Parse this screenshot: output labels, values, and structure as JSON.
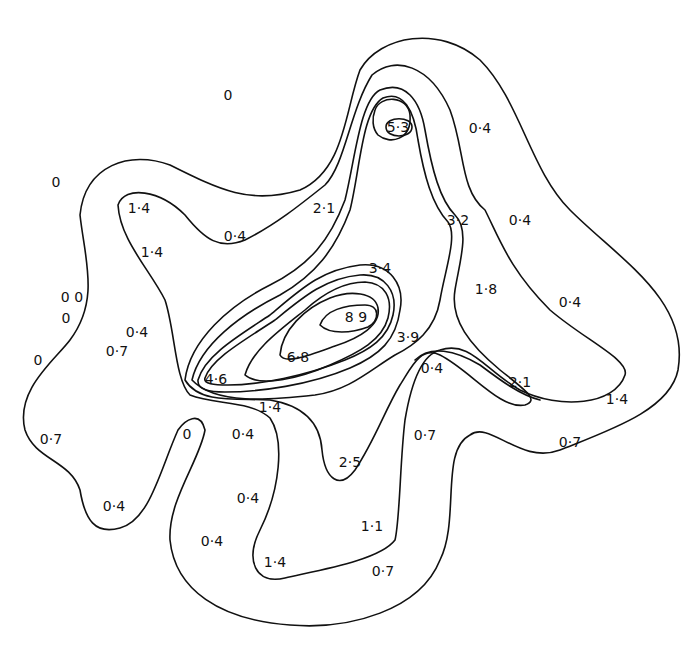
{
  "figure": {
    "type": "contour-map",
    "background": "#ffffff",
    "line_color": "#111111"
  },
  "labels": [
    {
      "text": "0",
      "x": 228,
      "y": 100
    },
    {
      "text": "0",
      "x": 56,
      "y": 187
    },
    {
      "text": "0 0",
      "x": 72,
      "y": 302
    },
    {
      "text": "0",
      "x": 66,
      "y": 323
    },
    {
      "text": "0",
      "x": 38,
      "y": 365
    },
    {
      "text": "1·4",
      "x": 139,
      "y": 213
    },
    {
      "text": "1·4",
      "x": 152,
      "y": 257
    },
    {
      "text": "0·4",
      "x": 235,
      "y": 241
    },
    {
      "text": "2·1",
      "x": 324,
      "y": 213
    },
    {
      "text": "5·3",
      "x": 398,
      "y": 132
    },
    {
      "text": "0·4",
      "x": 480,
      "y": 133
    },
    {
      "text": "3·2",
      "x": 458,
      "y": 225
    },
    {
      "text": "0·4",
      "x": 520,
      "y": 225
    },
    {
      "text": "3·4",
      "x": 380,
      "y": 273
    },
    {
      "text": "1·8",
      "x": 486,
      "y": 294
    },
    {
      "text": "0·4",
      "x": 570,
      "y": 307
    },
    {
      "text": "8 9",
      "x": 356,
      "y": 322
    },
    {
      "text": "3·9",
      "x": 408,
      "y": 342
    },
    {
      "text": "0·4",
      "x": 137,
      "y": 337
    },
    {
      "text": "0·7",
      "x": 117,
      "y": 356
    },
    {
      "text": "6·8",
      "x": 298,
      "y": 362
    },
    {
      "text": "4·6",
      "x": 216,
      "y": 384
    },
    {
      "text": "0·4",
      "x": 432,
      "y": 373
    },
    {
      "text": "2·1",
      "x": 520,
      "y": 387
    },
    {
      "text": "1·4",
      "x": 617,
      "y": 404
    },
    {
      "text": "1·4",
      "x": 270,
      "y": 412
    },
    {
      "text": "0",
      "x": 187,
      "y": 439
    },
    {
      "text": "0·4",
      "x": 243,
      "y": 439
    },
    {
      "text": "0·7",
      "x": 51,
      "y": 444
    },
    {
      "text": "0·7",
      "x": 425,
      "y": 440
    },
    {
      "text": "0·7",
      "x": 570,
      "y": 447
    },
    {
      "text": "2·5",
      "x": 350,
      "y": 467
    },
    {
      "text": "0·4",
      "x": 248,
      "y": 503
    },
    {
      "text": "0·4",
      "x": 114,
      "y": 511
    },
    {
      "text": "1·1",
      "x": 372,
      "y": 531
    },
    {
      "text": "0·4",
      "x": 212,
      "y": 546
    },
    {
      "text": "1·4",
      "x": 275,
      "y": 567
    },
    {
      "text": "0·7",
      "x": 383,
      "y": 576
    }
  ]
}
